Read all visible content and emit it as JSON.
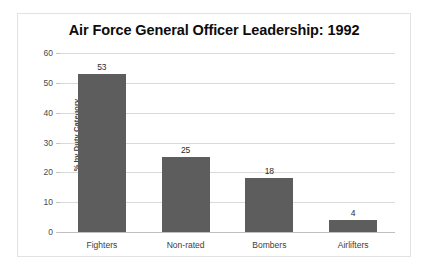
{
  "chart_data": {
    "type": "bar",
    "title": "Air Force General Officer Leadership: 1992",
    "xlabel": "",
    "ylabel": "% by Duty Category",
    "categories": [
      "Fighters",
      "Non-rated",
      "Bombers",
      "Airlifters"
    ],
    "values": [
      53,
      25,
      18,
      4
    ],
    "value_labels": [
      "53",
      "25",
      "18",
      "4"
    ],
    "ylim": [
      0,
      60
    ],
    "yticks": [
      0,
      10,
      20,
      30,
      40,
      50,
      60
    ],
    "ytick_labels": [
      "0",
      "10",
      "20",
      "30",
      "40",
      "50",
      "60"
    ],
    "grid": true,
    "legend": false,
    "legend_position": "none",
    "colors": {
      "bar": "#5d5d5d",
      "gridline": "#d9d9d9",
      "baseline": "#bfbfbf",
      "frame_border": "#e2e2e2",
      "background": "#ffffff",
      "title_text": "#0d0d0d",
      "tick_text": "#4a4a4a",
      "axis_title_text": "#3d3d3d"
    }
  }
}
